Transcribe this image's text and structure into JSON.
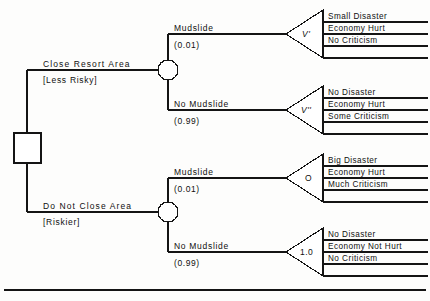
{
  "diagram": {
    "root": {
      "type": "decision-node",
      "shape": "square"
    },
    "branches": [
      {
        "id": "close",
        "label": "Close Resort Area",
        "note": "[Less Risky]",
        "chance_node": {
          "shape": "circle",
          "outcomes": [
            {
              "id": "close-mudslide",
              "label": "Mudslide",
              "probability": "(0.01)",
              "payoff_label": "V'",
              "payoff_italic": true,
              "consequences": [
                "Small Disaster",
                "Economy Hurt",
                "No Criticism"
              ]
            },
            {
              "id": "close-no-mudslide",
              "label": "No Mudslide",
              "probability": "(0.99)",
              "payoff_label": "V''",
              "payoff_italic": true,
              "consequences": [
                "No Disaster",
                "Economy Hurt",
                "Some Criticism"
              ]
            }
          ]
        }
      },
      {
        "id": "not-close",
        "label": "Do Not Close Area",
        "note": "[Riskier]",
        "chance_node": {
          "shape": "circle",
          "outcomes": [
            {
              "id": "open-mudslide",
              "label": "Mudslide",
              "probability": "(0.01)",
              "payoff_label": "O",
              "payoff_italic": false,
              "consequences": [
                "Big Disaster",
                "Economy Hurt",
                "Much Criticism"
              ]
            },
            {
              "id": "open-no-mudslide",
              "label": "No Mudslide",
              "probability": "(0.99)",
              "payoff_label": "1.0",
              "payoff_italic": false,
              "consequences": [
                "No Disaster",
                "Economy Not Hurt",
                "No Criticism"
              ]
            }
          ]
        }
      }
    ],
    "colors": {
      "ink": "#101010",
      "paper": "#fdfdfc"
    }
  }
}
